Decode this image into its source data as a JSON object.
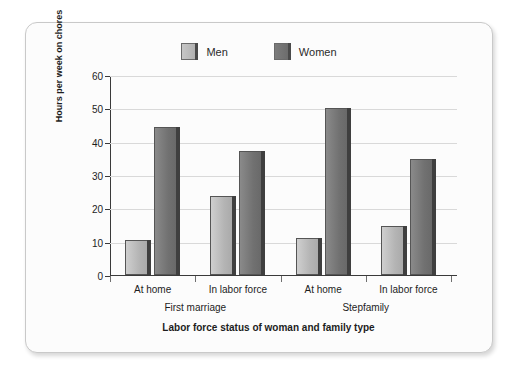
{
  "chart_data": {
    "type": "bar",
    "title": "",
    "xlabel": "Labor force status of woman and family type",
    "ylabel": "Hours per week on chores",
    "ylim": [
      0,
      60
    ],
    "yticks": [
      0,
      10,
      20,
      30,
      40,
      50,
      60
    ],
    "grid": true,
    "legend_position": "top-center",
    "categories": [
      "At home",
      "In labor force",
      "At home",
      "In labor force"
    ],
    "groups": [
      {
        "name": "First marriage",
        "categories": [
          "At home",
          "In labor force"
        ]
      },
      {
        "name": "Stepfamily",
        "categories": [
          "At home",
          "In labor force"
        ]
      }
    ],
    "series": [
      {
        "name": "Men",
        "color": "#b4b4b4",
        "values": [
          10.5,
          23.7,
          11.2,
          14.8
        ]
      },
      {
        "name": "Women",
        "color": "#717171",
        "values": [
          44.5,
          37.2,
          50.2,
          34.9
        ]
      }
    ]
  },
  "legend": {
    "items": [
      {
        "label": "Men",
        "swatch": "men-swatch"
      },
      {
        "label": "Women",
        "swatch": "women-swatch"
      }
    ]
  },
  "axes": {
    "y_title": "Hours per week on chores",
    "y_ticks": [
      "0",
      "10",
      "20",
      "30",
      "40",
      "50",
      "60"
    ],
    "x_title": "Labor force status of woman and family type",
    "x_ticks": [
      "At home",
      "In labor force",
      "At home",
      "In labor force"
    ],
    "x_groups": [
      "First marriage",
      "Stepfamily"
    ]
  },
  "colors": {
    "men": "#b4b4b4",
    "women": "#717171",
    "grid": "#d9d9d9",
    "axis": "#3a3a3a",
    "card_border": "#c9c9c9",
    "card_bg": "#fcfcfc",
    "text": "#1d1d1d"
  }
}
